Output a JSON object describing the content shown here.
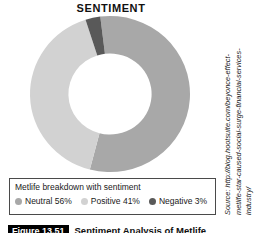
{
  "chart_data": {
    "type": "pie",
    "variant": "donut",
    "title": "SENTIMENT",
    "categories": [
      "Neutral",
      "Positive",
      "Negative"
    ],
    "values": [
      56,
      41,
      3
    ],
    "value_suffix": "%",
    "labels": [
      "Neutral 56%",
      "Positive 41%",
      "Negative 3%"
    ],
    "colors": [
      "#a8a8a8",
      "#d2d2d2",
      "#595959"
    ],
    "legend_position": "bottom",
    "legend_title": "Metlife breakdown with sentiment",
    "grid": false,
    "start_angle_deg": -7,
    "inner_radius_ratio": 0.52,
    "xlabel": "",
    "ylabel": ""
  },
  "header": {
    "title": "SENTIMENT"
  },
  "legend": {
    "caption": "Metlife breakdown with sentiment",
    "items": [
      {
        "label": "Neutral 56%",
        "color": "#a8a8a8",
        "name": "neutral"
      },
      {
        "label": "Positive 41%",
        "color": "#d2d2d2",
        "name": "positive"
      },
      {
        "label": "Negative 3%",
        "color": "#595959",
        "name": "negative"
      }
    ]
  },
  "source": {
    "line1": "Source: http://blog.hootsuite.com/beyonce-effect-",
    "line2": "metlife-star-caused-social-surge-financial-services-",
    "line3": "industry/"
  },
  "caption": {
    "tag": "Figure 13.51",
    "text": "Sentiment Analysis of Metlife"
  },
  "colors": {
    "neutral": "#a8a8a8",
    "positive": "#d2d2d2",
    "negative": "#595959",
    "border": "#4a4a4a",
    "background": "#ffffff",
    "text": "#1a1a1a"
  }
}
